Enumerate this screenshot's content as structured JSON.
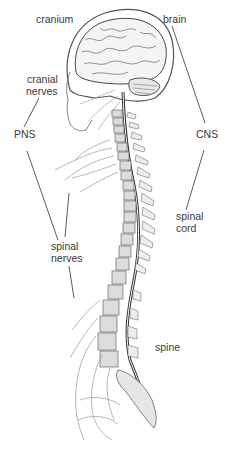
{
  "diagram": {
    "labels": {
      "cranium": "cranium",
      "brain": "brain",
      "cranial_nerves_line1": "cranial",
      "cranial_nerves_line2": "nerves",
      "pns": "PNS",
      "cns": "CNS",
      "spinal_cord_line1": "spinal",
      "spinal_cord_line2": "cord",
      "spinal_nerves_line1": "spinal",
      "spinal_nerves_line2": "nerves",
      "spine": "spine"
    },
    "colors": {
      "ink": "#3a3a3a",
      "line": "#4a4a4a",
      "bone_fill": "#d9d9d9",
      "background": "#ffffff"
    }
  }
}
